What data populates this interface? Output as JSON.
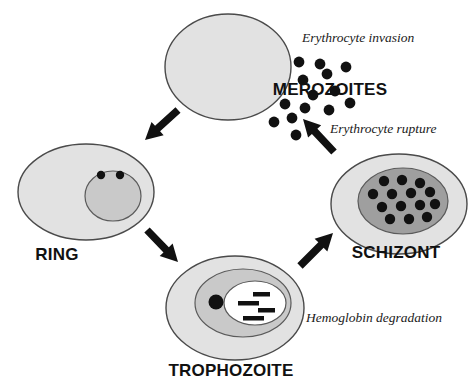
{
  "figure": {
    "background_color": "#ffffff"
  },
  "colors": {
    "cell_fill": "#e2e2e2",
    "cell_stroke": "#4a4a4a",
    "parasite_fill_light": "#c9c9c9",
    "parasite_fill_dark": "#9f9f9f",
    "vacuole_fill": "#ffffff",
    "dot_color": "#111111",
    "text_color": "#111111",
    "arrow_color": "#111111"
  },
  "stage_labels": {
    "merozoites": "MEROZOITES",
    "ring": "RING",
    "trophozoite": "TROPHOZOITE",
    "schizont": "SCHIZONT"
  },
  "process_labels": {
    "invasion": "Erythrocyte   invasion",
    "rupture": "Erythrocyte   rupture",
    "hemoglobin": "Hemoglobin   degradation"
  },
  "cells": {
    "erythrocyte": {
      "name": "uninfected erythrocyte",
      "cx": 228,
      "cy": 67,
      "rx": 63,
      "ry": 53
    },
    "ring": {
      "name": "ring stage infected erythrocyte",
      "cx": 86,
      "cy": 192,
      "rx": 68,
      "ry": 48,
      "parasite": {
        "cx": 113,
        "cy": 196,
        "rx": 28,
        "ry": 25
      },
      "chromatin_dots": [
        {
          "cx": 101,
          "cy": 175,
          "r": 4.2
        },
        {
          "cx": 120,
          "cy": 175,
          "r": 4.2
        }
      ]
    },
    "trophozoite": {
      "name": "trophozoite stage infected erythrocyte",
      "cx": 235,
      "cy": 308,
      "rx": 69,
      "ry": 52,
      "parasite": {
        "cx": 243,
        "cy": 303,
        "rx": 48,
        "ry": 34
      },
      "vacuole": {
        "cx": 255,
        "cy": 303,
        "rx": 31,
        "ry": 22
      },
      "chromatin_dots": [
        {
          "cx": 216,
          "cy": 302,
          "r": 7.5
        }
      ],
      "hemozoin_bars": [
        {
          "x": 253,
          "y": 292,
          "w": 17,
          "h": 4.5
        },
        {
          "x": 238,
          "y": 301,
          "w": 21,
          "h": 4.5
        },
        {
          "x": 258,
          "y": 308,
          "w": 17,
          "h": 4.5
        },
        {
          "x": 243,
          "y": 316,
          "w": 21,
          "h": 4.5
        }
      ]
    },
    "schizont": {
      "name": "schizont stage infected erythrocyte",
      "cx": 399,
      "cy": 204,
      "rx": 68,
      "ry": 50,
      "parasite": {
        "cx": 403,
        "cy": 201,
        "rx": 45,
        "ry": 33
      },
      "merozoite_nuclei": [
        {
          "cx": 384,
          "cy": 181,
          "r": 5.2
        },
        {
          "cx": 402,
          "cy": 180,
          "r": 5.2
        },
        {
          "cx": 420,
          "cy": 183,
          "r": 5.2
        },
        {
          "cx": 373,
          "cy": 194,
          "r": 5.2
        },
        {
          "cx": 392,
          "cy": 194,
          "r": 5.2
        },
        {
          "cx": 411,
          "cy": 193,
          "r": 5.2
        },
        {
          "cx": 430,
          "cy": 192,
          "r": 5.2
        },
        {
          "cx": 382,
          "cy": 207,
          "r": 5.2
        },
        {
          "cx": 401,
          "cy": 206,
          "r": 5.2
        },
        {
          "cx": 420,
          "cy": 205,
          "r": 5.2
        },
        {
          "cx": 435,
          "cy": 204,
          "r": 5.2
        },
        {
          "cx": 390,
          "cy": 219,
          "r": 5.2
        },
        {
          "cx": 409,
          "cy": 219,
          "r": 5.2
        },
        {
          "cx": 427,
          "cy": 217,
          "r": 5.2
        }
      ]
    }
  },
  "free_merozoites": [
    {
      "cx": 299,
      "cy": 62,
      "r": 5.4
    },
    {
      "cx": 320,
      "cy": 64,
      "r": 5.4
    },
    {
      "cx": 303,
      "cy": 80,
      "r": 5.4
    },
    {
      "cx": 327,
      "cy": 74,
      "r": 5.4
    },
    {
      "cx": 346,
      "cy": 67,
      "r": 5.4
    },
    {
      "cx": 313,
      "cy": 95,
      "r": 5.4
    },
    {
      "cx": 335,
      "cy": 91,
      "r": 5.4
    },
    {
      "cx": 285,
      "cy": 104,
      "r": 5.4
    },
    {
      "cx": 305,
      "cy": 108,
      "r": 5.4
    },
    {
      "cx": 329,
      "cy": 110,
      "r": 5.4
    },
    {
      "cx": 350,
      "cy": 103,
      "r": 5.4
    },
    {
      "cx": 274,
      "cy": 122,
      "r": 5.4
    },
    {
      "cx": 292,
      "cy": 118,
      "r": 5.4
    },
    {
      "cx": 296,
      "cy": 135,
      "r": 5.4
    }
  ],
  "arrows": [
    {
      "name": "erythrocyte-to-ring",
      "direction": "down-left",
      "x1": 178,
      "y1": 110,
      "x2": 145,
      "y2": 140
    },
    {
      "name": "ring-to-trophozoite",
      "direction": "down-right",
      "x1": 147,
      "y1": 230,
      "x2": 178,
      "y2": 262
    },
    {
      "name": "trophozoite-to-schizont",
      "direction": "up-right",
      "x1": 300,
      "y1": 266,
      "x2": 333,
      "y2": 233
    },
    {
      "name": "schizont-to-merozoites",
      "direction": "up-left",
      "x1": 334,
      "y1": 152,
      "x2": 303,
      "y2": 119
    }
  ],
  "label_positions": {
    "merozoites": {
      "x": 330,
      "y": 95
    },
    "ring": {
      "x": 57,
      "y": 260
    },
    "trophozoite": {
      "x": 231,
      "y": 376
    },
    "schizont": {
      "x": 396,
      "y": 258
    },
    "invasion": {
      "x": 302,
      "y": 42
    },
    "rupture": {
      "x": 330,
      "y": 133
    },
    "hemoglobin": {
      "x": 306,
      "y": 322
    }
  }
}
